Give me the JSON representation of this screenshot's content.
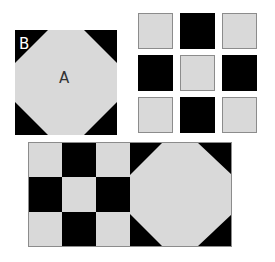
{
  "colors": {
    "light": "#d9d9d9",
    "dark": "#000000",
    "border": "#8c8c8c",
    "label_a": "#333333",
    "label_b": "#ffffff"
  },
  "block1": {
    "label_a": "A",
    "label_b": "B"
  },
  "grid": {
    "cells": [
      "light",
      "dark",
      "light",
      "dark",
      "light",
      "dark",
      "light",
      "dark",
      "light"
    ]
  },
  "combined": {
    "ninepatch": [
      "light",
      "dark",
      "light",
      "dark",
      "light",
      "dark",
      "light",
      "dark",
      "light"
    ]
  }
}
